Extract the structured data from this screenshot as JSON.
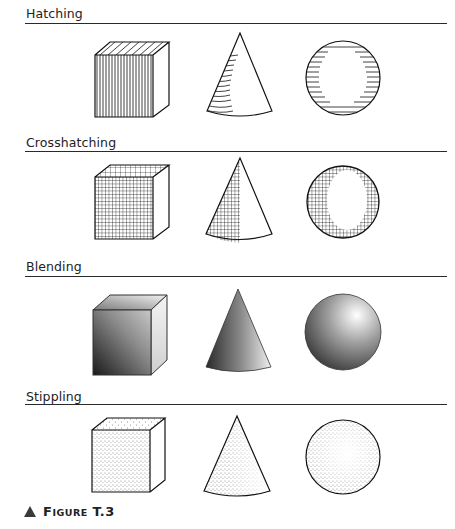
{
  "sections": [
    {
      "label": "Hatching",
      "shapes": [
        "cube",
        "cone",
        "sphere"
      ],
      "technique": "parallel lines"
    },
    {
      "label": "Crosshatching",
      "shapes": [
        "cube",
        "cone",
        "sphere"
      ],
      "technique": "intersecting lines"
    },
    {
      "label": "Blending",
      "shapes": [
        "cube",
        "cone",
        "sphere"
      ],
      "technique": "smooth gradient"
    },
    {
      "label": "Stippling",
      "shapes": [
        "cube",
        "cone",
        "sphere"
      ],
      "technique": "dots"
    }
  ],
  "caption": {
    "icon": "triangle-marker-icon",
    "prefix_big": "F",
    "prefix_small": "IGURE",
    "number": "T.3"
  }
}
